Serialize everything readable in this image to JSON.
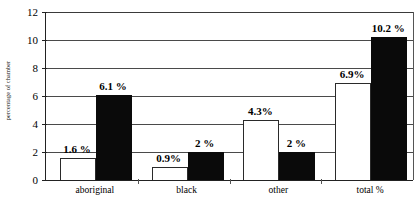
{
  "chart_data": {
    "type": "bar",
    "title": "",
    "xlabel": "",
    "ylabel": "percentage of chamber",
    "ylim": [
      0,
      12
    ],
    "yticks": [
      0,
      2,
      4,
      6,
      8,
      10,
      12
    ],
    "ytick_labels": [
      "0",
      "2",
      "4",
      "6",
      "8",
      "10",
      "12"
    ],
    "grid": "horizontal",
    "legend": "none",
    "categories": [
      "aboriginal",
      "black",
      "other",
      "total %"
    ],
    "series": [
      {
        "name": "light",
        "style": "white-filled-black-outline",
        "values": [
          1.6,
          0.9,
          4.3,
          6.9
        ],
        "labels": [
          "1.6 %",
          "0.9%",
          "4.3%",
          "6.9%"
        ]
      },
      {
        "name": "dark",
        "style": "black-filled",
        "values": [
          6.1,
          2.0,
          2.0,
          10.2
        ],
        "labels": [
          "6.1 %",
          "2 %",
          "2 %",
          "10.2 %"
        ]
      }
    ]
  },
  "colors": {
    "light_bar_fill": "#ffffff",
    "light_bar_stroke": "#2a2a2a",
    "dark_bar_fill": "#0a0a0a",
    "gridline": "#4a4a4a",
    "axis": "#222222",
    "text": "#000000",
    "background": "#ffffff"
  }
}
